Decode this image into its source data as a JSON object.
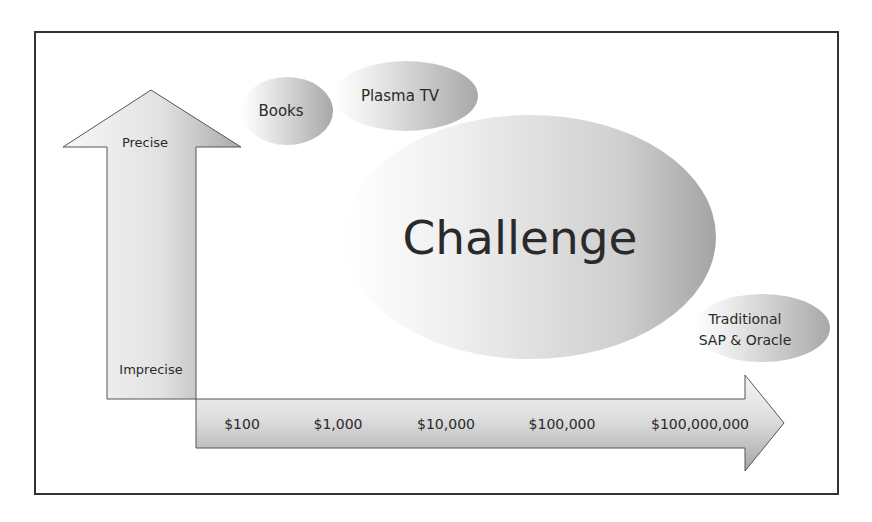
{
  "diagram": {
    "type": "positioning-map",
    "frame": {
      "border_color": "#333333",
      "background": "#ffffff"
    },
    "vertical_axis": {
      "top_label": "Precise",
      "bottom_label": "Imprecise"
    },
    "horizontal_axis": {
      "ticks": [
        "$100",
        "$1,000",
        "$10,000",
        "$100,000",
        "$100,000,000"
      ]
    },
    "bubbles": [
      {
        "id": "books",
        "label": "Books"
      },
      {
        "id": "plasma-tv",
        "label": "Plasma TV"
      },
      {
        "id": "challenge",
        "label": "Challenge"
      },
      {
        "id": "traditional",
        "label_line1": "Traditional",
        "label_line2": "SAP & Oracle"
      }
    ],
    "colors": {
      "gradient_light": "#f4f4f4",
      "gradient_dark": "#a9a9a9",
      "text": "#2a2a2a",
      "outline": "#555555"
    }
  }
}
